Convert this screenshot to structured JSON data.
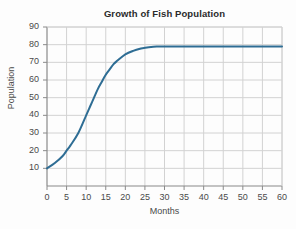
{
  "chart_data": {
    "type": "line",
    "title": "Growth of Fish Population",
    "xlabel": "Months",
    "ylabel": "Population",
    "xlim": [
      0,
      60
    ],
    "ylim": [
      0,
      90
    ],
    "xticks": [
      0,
      5,
      10,
      15,
      20,
      25,
      30,
      35,
      40,
      45,
      50,
      55,
      60
    ],
    "yticks": [
      10,
      20,
      30,
      40,
      50,
      60,
      70,
      80,
      90
    ],
    "grid": true,
    "legend": "none",
    "line_color": "#2e6d94",
    "grid_color": "#d2d2d2",
    "axis_color": "#8a8a8a",
    "background": "#fdfdfd",
    "series": [
      {
        "name": "Fish Population",
        "x": [
          0,
          2,
          4,
          5,
          6,
          8,
          10,
          11,
          12,
          13,
          14,
          15,
          16,
          17,
          18,
          20,
          22,
          24,
          25,
          26,
          28,
          30,
          32,
          35,
          40,
          45,
          50,
          55,
          60
        ],
        "values": [
          10,
          13,
          17,
          20,
          23,
          30,
          40,
          45,
          50,
          55,
          59,
          63,
          66,
          69,
          71,
          74.5,
          76.5,
          77.8,
          78.2,
          78.5,
          78.9,
          79,
          79,
          79,
          79,
          79,
          79,
          79,
          79
        ]
      }
    ]
  }
}
